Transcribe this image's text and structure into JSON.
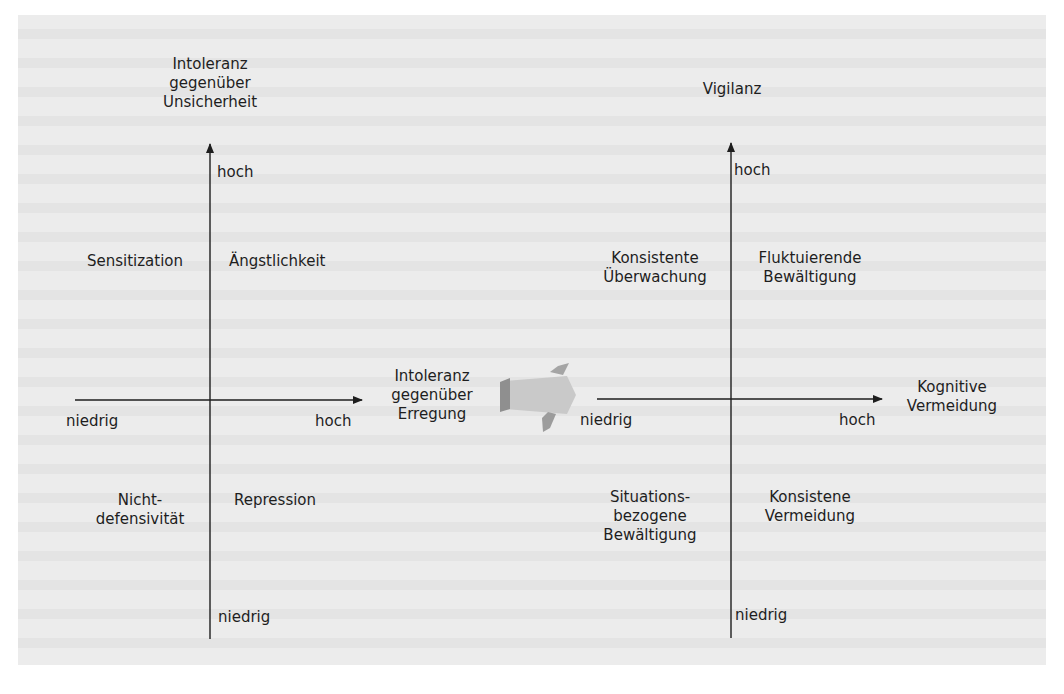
{
  "diagrams": [
    {
      "name": "left-quadrant",
      "y_axis_title": "Intoleranz\ngegenüber\nUnsicherheit",
      "x_axis_title": "Intoleranz\ngegenüber\nErregung",
      "y_high": "hoch",
      "y_low": "niedrig",
      "x_low": "niedrig",
      "x_high": "hoch",
      "quadrants": {
        "top_left": "Sensitization",
        "top_right": "Ängstlichkeit",
        "bottom_left": "Nicht-\ndefensivität",
        "bottom_right": "Repression"
      }
    },
    {
      "name": "right-quadrant",
      "y_axis_title": "Vigilanz",
      "x_axis_title": "Kognitive\nVermeidung",
      "y_high": "hoch",
      "y_low": "niedrig",
      "x_low": "niedrig",
      "x_high": "hoch",
      "quadrants": {
        "top_left": "Konsistente\nÜberwachung",
        "top_right": "Fluktuierende\nBewältigung",
        "bottom_left": "Situations-\nbezogene\nBewältigung",
        "bottom_right": "Konsistene\nVermeidung"
      }
    }
  ],
  "connector": {
    "icon": "block-arrow-right-icon",
    "color": "#a8a8a8"
  },
  "colors": {
    "background": "#ececec",
    "ink": "#1e1e1e"
  }
}
